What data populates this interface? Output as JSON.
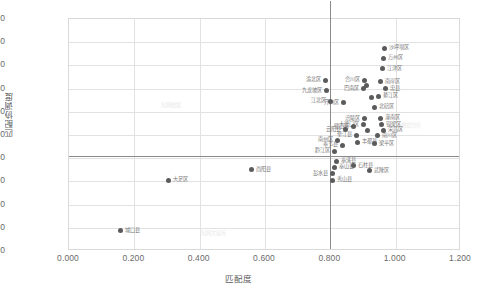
{
  "chart_data": {
    "type": "scatter",
    "title": "",
    "xlabel": "匹配度",
    "ylabel": "匹配协调度",
    "xlim": [
      0.0,
      1.2
    ],
    "ylim": [
      0.0,
      1.0
    ],
    "xticks": [
      "0.000",
      "0.200",
      "0.400",
      "0.600",
      "0.800",
      "1.000",
      "1.200"
    ],
    "yticks": [
      "0.000",
      "0.100",
      "0.200",
      "0.300",
      "0.400",
      "0.500",
      "0.600",
      "0.700",
      "0.800",
      "0.900",
      "1.000"
    ],
    "grid": true,
    "legend": "none",
    "reference_lines": [
      {
        "orientation": "horizontal",
        "value": 0.41,
        "name": "mean-coordination-line"
      },
      {
        "orientation": "vertical",
        "value": 0.8,
        "name": "mean-match-line"
      }
    ],
    "points": [
      {
        "label": "沙坪坝区",
        "x": 0.965,
        "y": 0.875,
        "lp": "r"
      },
      {
        "label": "万州区",
        "x": 0.962,
        "y": 0.83,
        "lp": "r"
      },
      {
        "label": "江津区",
        "x": 0.96,
        "y": 0.785,
        "lp": "r"
      },
      {
        "label": "南岸区",
        "x": 0.955,
        "y": 0.73,
        "lp": "r"
      },
      {
        "label": "合川区",
        "x": 0.905,
        "y": 0.735,
        "lp": "l"
      },
      {
        "label": "忠县",
        "x": 0.968,
        "y": 0.7,
        "lp": "r"
      },
      {
        "label": "巴南区",
        "x": 0.9,
        "y": 0.7,
        "lp": "l"
      },
      {
        "label": "长寿区",
        "x": 0.912,
        "y": 0.712,
        "lp": "none"
      },
      {
        "label": "綦江区",
        "x": 0.948,
        "y": 0.668,
        "lp": "r"
      },
      {
        "label": "永川区",
        "x": 0.925,
        "y": 0.66,
        "lp": "none"
      },
      {
        "label": "渝北区",
        "x": 0.785,
        "y": 0.735,
        "lp": "l"
      },
      {
        "label": "九龙坡区",
        "x": 0.787,
        "y": 0.69,
        "lp": "l"
      },
      {
        "label": "江北区",
        "x": 0.8,
        "y": 0.645,
        "lp": "l"
      },
      {
        "label": "开州区",
        "x": 0.84,
        "y": 0.64,
        "lp": "l"
      },
      {
        "label": "北碚区",
        "x": 0.935,
        "y": 0.62,
        "lp": "r"
      },
      {
        "label": "涪陵区",
        "x": 0.906,
        "y": 0.57,
        "lp": "l"
      },
      {
        "label": "潼南区",
        "x": 0.953,
        "y": 0.572,
        "lp": "r"
      },
      {
        "label": "大渡口区",
        "x": 0.903,
        "y": 0.545,
        "lp": "l"
      },
      {
        "label": "璧山区",
        "x": 0.872,
        "y": 0.535,
        "lp": "l"
      },
      {
        "label": "铜梁区",
        "x": 0.958,
        "y": 0.545,
        "lp": "r"
      },
      {
        "label": "荣昌区",
        "x": 0.962,
        "y": 0.52,
        "lp": "r"
      },
      {
        "label": "渝中区",
        "x": 0.915,
        "y": 0.52,
        "lp": "none"
      },
      {
        "label": "云阳县",
        "x": 0.846,
        "y": 0.523,
        "lp": "l"
      },
      {
        "label": "垫江县",
        "x": 0.88,
        "y": 0.5,
        "lp": "l"
      },
      {
        "label": "南川区",
        "x": 0.944,
        "y": 0.497,
        "lp": "r"
      },
      {
        "label": "南州区",
        "x": 0.822,
        "y": 0.478,
        "lp": "l"
      },
      {
        "label": "丰都县",
        "x": 0.883,
        "y": 0.468,
        "lp": "r"
      },
      {
        "label": "梁平区",
        "x": 0.936,
        "y": 0.462,
        "lp": "r"
      },
      {
        "label": "奉节县",
        "x": 0.836,
        "y": 0.455,
        "lp": "l"
      },
      {
        "label": "黔江区",
        "x": 0.812,
        "y": 0.43,
        "lp": "l"
      },
      {
        "label": "巫溪县",
        "x": 0.818,
        "y": 0.386,
        "lp": "r"
      },
      {
        "label": "巫山县",
        "x": 0.812,
        "y": 0.36,
        "lp": "r"
      },
      {
        "label": "石柱县",
        "x": 0.872,
        "y": 0.368,
        "lp": "r"
      },
      {
        "label": "武隆区",
        "x": 0.92,
        "y": 0.345,
        "lp": "r"
      },
      {
        "label": "彭水县",
        "x": 0.806,
        "y": 0.332,
        "lp": "l"
      },
      {
        "label": "秀山县",
        "x": 0.806,
        "y": 0.305,
        "lp": "r"
      },
      {
        "label": "酉阳县",
        "x": 0.56,
        "y": 0.35,
        "lp": "r"
      },
      {
        "label": "大足区",
        "x": 0.305,
        "y": 0.305,
        "lp": "r"
      },
      {
        "label": "城口县",
        "x": 0.158,
        "y": 0.088,
        "lp": "r"
      }
    ]
  },
  "watermarks": [
    {
      "text": "知网数据",
      "x": 160,
      "y": 100
    },
    {
      "text": "数据分析",
      "x": 400,
      "y": 120
    },
    {
      "text": "知网文献库",
      "x": 200,
      "y": 228
    }
  ]
}
